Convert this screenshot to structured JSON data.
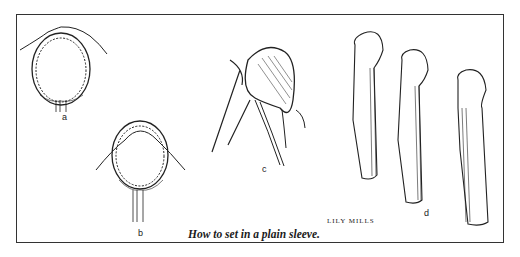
{
  "figure": {
    "caption": "How to set in a plain sleeve.",
    "credit": "LILY MILLS",
    "panels": [
      {
        "id": "a",
        "label": "a",
        "description": "sleeve cap pinned into armhole, front view"
      },
      {
        "id": "b",
        "label": "b",
        "description": "sleeve basted into armhole, seam allowance eased"
      },
      {
        "id": "c",
        "label": "c",
        "description": "stitching sleeve into armhole, shaded cap"
      },
      {
        "id": "d",
        "label": "d",
        "description": "three sleeve views showing underarm seam steps"
      }
    ]
  }
}
